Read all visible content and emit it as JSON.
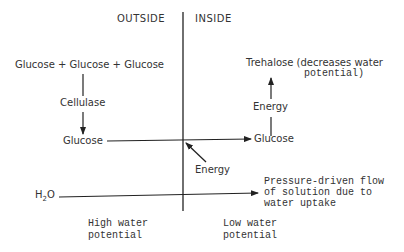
{
  "regions": {
    "outside": "OUTSIDE",
    "inside": "INSIDE"
  },
  "outside": {
    "polymer": "Glucose + Glucose + Glucose",
    "enzyme": "Cellulase",
    "glucose": "Glucose",
    "water": "H",
    "water_sub": "2",
    "water_o": "O",
    "potential_line1": "High water",
    "potential_line2": "potential"
  },
  "inside": {
    "trehalose_line1": "Trehalose (decreases water",
    "trehalose_line2": "potential)",
    "energy_upper": "Energy",
    "glucose": "Glucose",
    "energy_lower": "Energy",
    "flow_line1": "Pressure-driven flow",
    "flow_line2": "of solution due to",
    "flow_line3": "water uptake",
    "potential_line1": "Low water",
    "potential_line2": "potential"
  }
}
